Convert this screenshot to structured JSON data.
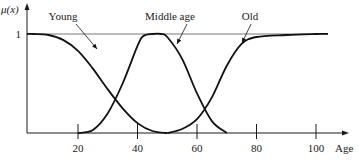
{
  "chart_data": {
    "type": "line",
    "title": "",
    "xlabel": "Age",
    "ylabel": "μ(x)",
    "xlim": [
      -3,
      110
    ],
    "ylim": [
      0,
      1
    ],
    "xticks": [
      20,
      40,
      60,
      80,
      100
    ],
    "xtick_labels": [
      "20",
      "40",
      "60",
      "80",
      "100"
    ],
    "yticks": [
      1
    ],
    "ytick_labels": [
      "1"
    ],
    "grid": false,
    "series": [
      {
        "name": "Young",
        "x": [
          -3,
          5,
          10,
          15,
          20,
          25,
          30,
          35,
          40,
          45,
          50
        ],
        "y": [
          1,
          1,
          0.99,
          0.94,
          0.83,
          0.65,
          0.44,
          0.25,
          0.1,
          0.02,
          0
        ]
      },
      {
        "name": "Middle age",
        "x": [
          20,
          25,
          30,
          35,
          40,
          42,
          45,
          48,
          50,
          55,
          60,
          65,
          70
        ],
        "y": [
          0,
          0.03,
          0.2,
          0.5,
          0.88,
          0.98,
          1,
          1,
          0.97,
          0.75,
          0.4,
          0.12,
          0
        ]
      },
      {
        "name": "Old",
        "x": [
          50,
          55,
          60,
          65,
          70,
          75,
          80,
          90,
          100,
          104
        ],
        "y": [
          0,
          0.04,
          0.14,
          0.36,
          0.68,
          0.9,
          0.97,
          0.99,
          1,
          1
        ]
      }
    ],
    "annotations": [
      {
        "text": "Young",
        "points_to_series": "Young"
      },
      {
        "text": "Middle age",
        "points_to_series": "Middle age"
      },
      {
        "text": "Old",
        "points_to_series": "Old"
      }
    ]
  }
}
